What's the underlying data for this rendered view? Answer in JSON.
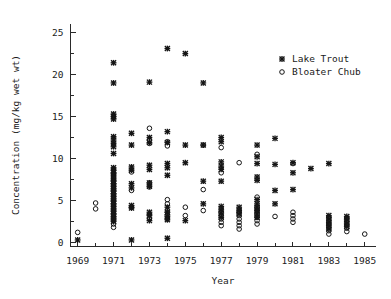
{
  "chart_data": {
    "type": "scatter",
    "title": "",
    "xlabel": "Year",
    "ylabel": "Concentration (mg/kg wet wt)",
    "xlim": [
      1968.6,
      1985.6
    ],
    "ylim": [
      -0.6,
      26.2
    ],
    "grid": false,
    "legend_position": "top-right",
    "x_ticks_major": [
      1969,
      1971,
      1973,
      1975,
      1977,
      1979,
      1981,
      1983,
      1985
    ],
    "x_ticklabels": [
      "1969",
      "1971",
      "1973",
      "1975",
      "1977",
      "1979",
      "1981",
      "1983",
      "1985"
    ],
    "x_ticks_minor": [
      1970,
      1972,
      1974,
      1976,
      1978,
      1980,
      1982,
      1984
    ],
    "y_ticks_major": [
      0,
      5,
      10,
      15,
      20,
      25
    ],
    "y_ticklabels": [
      "0",
      "5",
      "10",
      "15",
      "20",
      "25"
    ],
    "y_ticks_minor": [
      2.5,
      7.5,
      12.5,
      17.5,
      22.5
    ],
    "series": [
      {
        "name": "Lake Trout",
        "marker": "x",
        "color": "#151515",
        "points": [
          [
            1969.0,
            0.3
          ],
          [
            1971.0,
            21.4
          ],
          [
            1971.0,
            19.0
          ],
          [
            1971.0,
            15.3
          ],
          [
            1971.0,
            15.0
          ],
          [
            1971.0,
            14.7
          ],
          [
            1971.0,
            12.6
          ],
          [
            1971.0,
            12.2
          ],
          [
            1971.0,
            11.8
          ],
          [
            1971.0,
            11.4
          ],
          [
            1971.0,
            10.6
          ],
          [
            1971.0,
            8.9
          ],
          [
            1971.0,
            8.6
          ],
          [
            1971.0,
            8.3
          ],
          [
            1971.0,
            8.0
          ],
          [
            1971.0,
            7.6
          ],
          [
            1971.0,
            7.3
          ],
          [
            1971.0,
            7.0
          ],
          [
            1971.0,
            6.7
          ],
          [
            1971.0,
            6.4
          ],
          [
            1971.0,
            6.1
          ],
          [
            1971.0,
            5.8
          ],
          [
            1971.0,
            5.5
          ],
          [
            1971.0,
            5.2
          ],
          [
            1971.0,
            4.9
          ],
          [
            1971.0,
            4.6
          ],
          [
            1971.0,
            4.3
          ],
          [
            1971.0,
            4.0
          ],
          [
            1971.0,
            3.7
          ],
          [
            1971.0,
            3.4
          ],
          [
            1971.0,
            3.1
          ],
          [
            1971.0,
            2.8
          ],
          [
            1971.0,
            2.5
          ],
          [
            1972.0,
            13.0
          ],
          [
            1972.0,
            11.6
          ],
          [
            1972.0,
            9.0
          ],
          [
            1972.0,
            8.6
          ],
          [
            1972.0,
            7.0
          ],
          [
            1972.0,
            6.5
          ],
          [
            1972.0,
            4.4
          ],
          [
            1972.0,
            4.1
          ],
          [
            1972.0,
            0.3
          ],
          [
            1973.0,
            19.1
          ],
          [
            1973.0,
            12.5
          ],
          [
            1973.0,
            11.9
          ],
          [
            1973.0,
            9.2
          ],
          [
            1973.0,
            8.7
          ],
          [
            1973.0,
            7.1
          ],
          [
            1973.0,
            6.7
          ],
          [
            1973.0,
            3.6
          ],
          [
            1973.0,
            3.2
          ],
          [
            1973.0,
            2.6
          ],
          [
            1974.0,
            23.1
          ],
          [
            1974.0,
            13.2
          ],
          [
            1974.0,
            11.9
          ],
          [
            1974.0,
            9.4
          ],
          [
            1974.0,
            8.9
          ],
          [
            1974.0,
            8.0
          ],
          [
            1974.0,
            4.2
          ],
          [
            1974.0,
            3.6
          ],
          [
            1974.0,
            3.1
          ],
          [
            1974.0,
            2.7
          ],
          [
            1974.0,
            0.5
          ],
          [
            1975.0,
            22.5
          ],
          [
            1975.0,
            11.6
          ],
          [
            1975.0,
            9.5
          ],
          [
            1975.0,
            2.6
          ],
          [
            1976.0,
            19.0
          ],
          [
            1976.0,
            11.6
          ],
          [
            1976.0,
            7.3
          ],
          [
            1976.0,
            4.6
          ],
          [
            1977.0,
            12.5
          ],
          [
            1977.0,
            12.0
          ],
          [
            1977.0,
            9.6
          ],
          [
            1977.0,
            9.1
          ],
          [
            1977.0,
            8.7
          ],
          [
            1977.0,
            7.3
          ],
          [
            1977.0,
            4.3
          ],
          [
            1977.0,
            3.9
          ],
          [
            1977.0,
            3.5
          ],
          [
            1977.0,
            3.0
          ],
          [
            1978.0,
            4.2
          ],
          [
            1978.0,
            3.8
          ],
          [
            1978.0,
            3.4
          ],
          [
            1979.0,
            11.6
          ],
          [
            1979.0,
            10.2
          ],
          [
            1979.0,
            9.4
          ],
          [
            1979.0,
            7.8
          ],
          [
            1979.0,
            7.4
          ],
          [
            1979.0,
            5.1
          ],
          [
            1979.0,
            4.6
          ],
          [
            1979.0,
            4.2
          ],
          [
            1979.0,
            3.8
          ],
          [
            1979.0,
            3.4
          ],
          [
            1979.0,
            3.0
          ],
          [
            1980.0,
            12.4
          ],
          [
            1980.0,
            9.3
          ],
          [
            1980.0,
            6.2
          ],
          [
            1980.0,
            4.6
          ],
          [
            1981.0,
            9.5
          ],
          [
            1981.0,
            8.3
          ],
          [
            1981.0,
            6.3
          ],
          [
            1982.0,
            8.8
          ],
          [
            1983.0,
            9.4
          ],
          [
            1983.0,
            3.2
          ],
          [
            1983.0,
            2.8
          ],
          [
            1983.0,
            2.4
          ],
          [
            1983.0,
            2.0
          ],
          [
            1983.0,
            1.6
          ],
          [
            1984.0,
            3.1
          ],
          [
            1984.0,
            2.7
          ],
          [
            1984.0,
            2.3
          ],
          [
            1984.0,
            1.9
          ]
        ]
      },
      {
        "name": "Bloater Chub",
        "marker": "o",
        "color": "#151515",
        "points": [
          [
            1969.0,
            1.2
          ],
          [
            1970.0,
            4.7
          ],
          [
            1970.0,
            4.0
          ],
          [
            1971.0,
            8.2
          ],
          [
            1971.0,
            7.8
          ],
          [
            1971.0,
            7.4
          ],
          [
            1971.0,
            7.0
          ],
          [
            1971.0,
            6.6
          ],
          [
            1971.0,
            6.2
          ],
          [
            1971.0,
            5.8
          ],
          [
            1971.0,
            5.4
          ],
          [
            1971.0,
            5.0
          ],
          [
            1971.0,
            4.6
          ],
          [
            1971.0,
            4.2
          ],
          [
            1971.0,
            3.8
          ],
          [
            1971.0,
            3.4
          ],
          [
            1971.0,
            3.0
          ],
          [
            1971.0,
            2.6
          ],
          [
            1971.0,
            2.2
          ],
          [
            1971.0,
            1.8
          ],
          [
            1972.0,
            8.4
          ],
          [
            1972.0,
            6.2
          ],
          [
            1972.0,
            4.2
          ],
          [
            1973.0,
            13.6
          ],
          [
            1973.0,
            12.2
          ],
          [
            1973.0,
            11.8
          ],
          [
            1973.0,
            7.1
          ],
          [
            1973.0,
            6.6
          ],
          [
            1973.0,
            3.3
          ],
          [
            1973.0,
            2.8
          ],
          [
            1974.0,
            12.0
          ],
          [
            1974.0,
            11.5
          ],
          [
            1974.0,
            5.1
          ],
          [
            1974.0,
            4.6
          ],
          [
            1974.0,
            3.6
          ],
          [
            1974.0,
            3.2
          ],
          [
            1974.0,
            2.8
          ],
          [
            1975.0,
            4.2
          ],
          [
            1975.0,
            3.2
          ],
          [
            1976.0,
            11.6
          ],
          [
            1976.0,
            6.3
          ],
          [
            1976.0,
            3.8
          ],
          [
            1977.0,
            11.3
          ],
          [
            1977.0,
            8.3
          ],
          [
            1977.0,
            3.6
          ],
          [
            1977.0,
            3.2
          ],
          [
            1977.0,
            2.8
          ],
          [
            1977.0,
            2.4
          ],
          [
            1977.0,
            2.0
          ],
          [
            1978.0,
            9.5
          ],
          [
            1978.0,
            3.6
          ],
          [
            1978.0,
            3.2
          ],
          [
            1978.0,
            2.8
          ],
          [
            1978.0,
            2.4
          ],
          [
            1978.0,
            2.0
          ],
          [
            1978.0,
            1.6
          ],
          [
            1979.0,
            10.5
          ],
          [
            1979.0,
            5.4
          ],
          [
            1979.0,
            4.2
          ],
          [
            1979.0,
            3.8
          ],
          [
            1979.0,
            3.4
          ],
          [
            1979.0,
            3.0
          ],
          [
            1979.0,
            2.6
          ],
          [
            1979.0,
            2.2
          ],
          [
            1980.0,
            3.1
          ],
          [
            1981.0,
            9.4
          ],
          [
            1981.0,
            3.6
          ],
          [
            1981.0,
            3.2
          ],
          [
            1981.0,
            2.8
          ],
          [
            1981.0,
            2.4
          ],
          [
            1983.0,
            3.0
          ],
          [
            1983.0,
            2.6
          ],
          [
            1983.0,
            2.2
          ],
          [
            1983.0,
            1.8
          ],
          [
            1983.0,
            1.4
          ],
          [
            1983.0,
            1.0
          ],
          [
            1984.0,
            2.9
          ],
          [
            1984.0,
            2.5
          ],
          [
            1984.0,
            2.1
          ],
          [
            1984.0,
            1.7
          ],
          [
            1984.0,
            1.3
          ],
          [
            1985.0,
            1.0
          ]
        ]
      }
    ],
    "legend": [
      {
        "label": "Lake Trout",
        "marker": "x"
      },
      {
        "label": "Bloater Chub",
        "marker": "o"
      }
    ]
  }
}
